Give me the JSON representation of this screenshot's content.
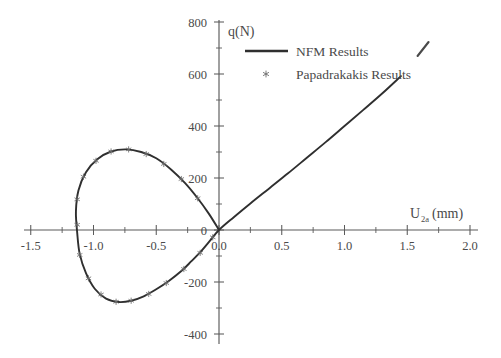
{
  "chart_data": {
    "type": "line",
    "title": "",
    "xlabel": "U2a (mm)",
    "xlabel_base": "U",
    "xlabel_sub": "2a",
    "xlabel_unit": "(mm)",
    "ylabel": "q(N)",
    "xlim": [
      -1.65,
      2.05
    ],
    "ylim": [
      -420,
      820
    ],
    "xticks": [
      -1.5,
      -1.0,
      -0.5,
      0.0,
      0.5,
      1.0,
      1.5,
      2.0
    ],
    "xticklabels": [
      "-1.5",
      "-1.0",
      "-0.5",
      "0.0",
      "0.5",
      "1.0",
      "1.5",
      "2.0"
    ],
    "yticks": [
      -400,
      -200,
      0,
      200,
      400,
      600,
      800
    ],
    "yticklabels": [
      "-400",
      "-200",
      "0",
      "200",
      "400",
      "600",
      "800"
    ],
    "grid": false,
    "legend_position": "top-center",
    "legend": [
      {
        "label": "NFM Results",
        "marker": "line",
        "color": "#2f2f2f"
      },
      {
        "label": "Papadrakakis Results",
        "marker": "star",
        "color": "#6b6b6b"
      }
    ],
    "series": [
      {
        "name": "NFM Results",
        "style": "line",
        "points": [
          [
            0.0,
            0.0
          ],
          [
            -0.08,
            62
          ],
          [
            -0.17,
            122
          ],
          [
            -0.27,
            180
          ],
          [
            -0.38,
            232
          ],
          [
            -0.5,
            276
          ],
          [
            -0.62,
            300
          ],
          [
            -0.74,
            310
          ],
          [
            -0.86,
            302
          ],
          [
            -0.97,
            272
          ],
          [
            -1.06,
            222
          ],
          [
            -1.12,
            152
          ],
          [
            -1.14,
            72
          ],
          [
            -1.13,
            -10
          ],
          [
            -1.11,
            -92
          ],
          [
            -1.06,
            -166
          ],
          [
            -0.99,
            -226
          ],
          [
            -0.9,
            -264
          ],
          [
            -0.8,
            -277
          ],
          [
            -0.7,
            -272
          ],
          [
            -0.6,
            -255
          ],
          [
            -0.5,
            -228
          ],
          [
            -0.4,
            -196
          ],
          [
            -0.3,
            -158
          ],
          [
            -0.22,
            -120
          ],
          [
            -0.14,
            -80
          ],
          [
            -0.07,
            -40
          ],
          [
            0.0,
            0.0
          ],
          [
            0.12,
            50
          ],
          [
            0.25,
            102
          ],
          [
            0.4,
            160
          ],
          [
            0.55,
            218
          ],
          [
            0.7,
            278
          ],
          [
            0.85,
            338
          ],
          [
            1.0,
            400
          ],
          [
            1.15,
            462
          ],
          [
            1.3,
            525
          ],
          [
            1.45,
            592
          ]
        ]
      },
      {
        "name": "Papadrakakis Results",
        "style": "star",
        "points": [
          [
            -0.17,
            122
          ],
          [
            -0.3,
            196
          ],
          [
            -0.44,
            254
          ],
          [
            -0.58,
            292
          ],
          [
            -0.72,
            310
          ],
          [
            -0.86,
            302
          ],
          [
            -0.98,
            266
          ],
          [
            -1.08,
            205
          ],
          [
            -1.13,
            118
          ],
          [
            -1.13,
            20
          ],
          [
            -1.11,
            -96
          ],
          [
            -1.04,
            -186
          ],
          [
            -0.94,
            -248
          ],
          [
            -0.82,
            -276
          ],
          [
            -0.7,
            -272
          ],
          [
            -0.56,
            -246
          ],
          [
            -0.42,
            -204
          ],
          [
            -0.28,
            -150
          ],
          [
            -0.15,
            -88
          ],
          [
            -0.05,
            -28
          ]
        ]
      }
    ],
    "annotations": [
      {
        "name": "scan-artifact",
        "x": 1.63,
        "y": 700
      }
    ]
  }
}
